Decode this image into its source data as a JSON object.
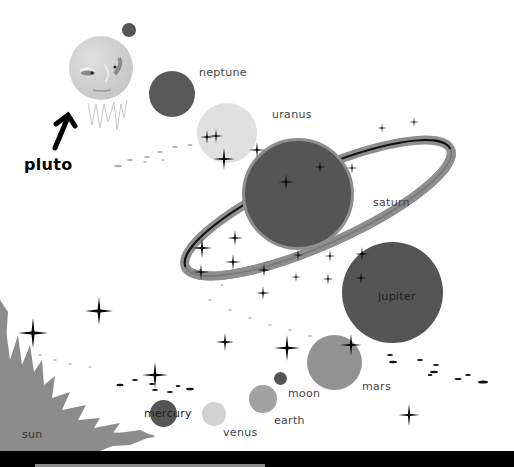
{
  "scene": {
    "title": "solar system illustration",
    "colors": {
      "background": "#ffffff",
      "dark_planet": "#555555",
      "mid_planet": "#8f8f8f",
      "light_planet": "#cfcfcf",
      "sun": "#8c8c8c",
      "stars": "#000000",
      "bottom_bar": "#000000"
    }
  },
  "labels": {
    "pluto": "pluto",
    "neptune": "neptune",
    "uranus": "uranus",
    "saturn": "saturn",
    "jupiter": "jupiter",
    "mars": "mars",
    "moon": "moon",
    "earth": "earth",
    "venus": "venus",
    "mercury": "mercury",
    "sun": "sun"
  }
}
